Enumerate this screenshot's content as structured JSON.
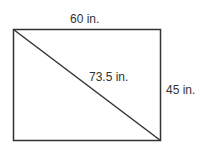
{
  "diagram": {
    "shape": "rectangle with diagonal",
    "labels": {
      "width": "60 in.",
      "height": "45 in.",
      "diagonal": "73.5 in."
    },
    "colors": {
      "stroke": "#333333",
      "text": "#333333",
      "background": "#ffffff"
    }
  }
}
